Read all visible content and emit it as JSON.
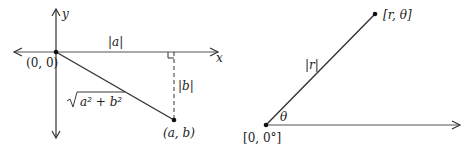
{
  "left_diagram": {
    "title": "Cartesian coordinates",
    "origin_label": "(0, 0)",
    "x_axis_label": "x",
    "y_axis_label": "y",
    "horizontal_leg_label": "|a|",
    "vertical_leg_label": "|b|",
    "hypotenuse_label": "√a² + b²",
    "hypotenuse_radicand": "a² + b²",
    "point_label": "(a, b)"
  },
  "right_diagram": {
    "title": "Polar coordinates",
    "origin_label": "[0, 0°]",
    "point_label": "[r, θ]",
    "ray_label": "|r|",
    "angle_label": "θ"
  },
  "colors": {
    "line": "#333333",
    "text": "#222222",
    "background": "#ffffff"
  }
}
